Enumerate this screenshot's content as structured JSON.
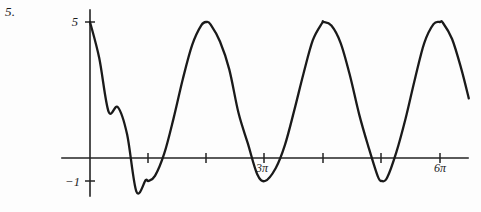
{
  "problem": {
    "number": "5."
  },
  "chart_data": {
    "type": "line",
    "title": "",
    "subtitle": "",
    "xlabel": "",
    "ylabel": "",
    "function_description": "y = 2 + 3 cos(x)",
    "amplitude": 3,
    "midline": 2,
    "period": "2π",
    "xlim": [
      0,
      20.4
    ],
    "ylim": [
      -1,
      5
    ],
    "grid": false,
    "legend": null,
    "axis_origin_label": "",
    "y_ticks": [
      {
        "value": 5,
        "label": "5"
      },
      {
        "value": -1,
        "label": "−1"
      }
    ],
    "x_ticks": [
      {
        "value": "π",
        "label": ""
      },
      {
        "value": "2π",
        "label": ""
      },
      {
        "value": "3π",
        "label": "3π"
      },
      {
        "value": "4π",
        "label": ""
      },
      {
        "value": "5π",
        "label": ""
      },
      {
        "value": "6π",
        "label": "6π"
      }
    ],
    "maxima": [
      {
        "x": "0",
        "y": 5
      },
      {
        "x": "2π",
        "y": 5
      },
      {
        "x": "4π",
        "y": 5
      },
      {
        "x": "6π",
        "y": 5
      }
    ],
    "minima": [
      {
        "x": "π",
        "y": -1
      },
      {
        "x": "3π",
        "y": -1
      },
      {
        "x": "5π",
        "y": -1
      }
    ],
    "series": [
      {
        "name": "y = 2 + 3 cos(x)",
        "color": "#1a1a1a",
        "x": [
          0,
          0.5,
          1,
          1.5,
          2,
          2.5,
          3,
          3.1416,
          3.5,
          4,
          4.5,
          5,
          5.5,
          6,
          6.2832,
          6.5,
          7,
          7.5,
          8,
          8.5,
          9,
          9.4248,
          10,
          10.5,
          11,
          11.5,
          12,
          12.5,
          12.5664,
          13,
          13.5,
          14,
          14.5,
          15,
          15.5,
          15.708,
          16,
          16.5,
          17,
          17.5,
          18,
          18.5,
          18.8496,
          19,
          19.5,
          20,
          20.4
        ],
        "y": [
          5,
          3.633,
          1.621,
          1.788,
          0.751,
          -1.403,
          -0.97,
          -1,
          -0.809,
          0.039,
          1.364,
          2.851,
          4.127,
          4.88,
          5,
          4.9,
          4.262,
          3.211,
          1.563,
          0.417,
          -0.733,
          -1,
          -0.517,
          0.363,
          1.664,
          3.055,
          4.313,
          4.962,
          5,
          4.864,
          4.205,
          2.98,
          1.506,
          0.28,
          -0.828,
          -1,
          -0.879,
          0.088,
          1.368,
          2.851,
          4.203,
          4.92,
          5,
          4.977,
          4.359,
          3.223,
          2.117
        ],
        "marker": "none",
        "line_style": "solid"
      }
    ]
  },
  "labels": {
    "y_max": "5",
    "y_min": "−1",
    "x_mid": "3π",
    "x_end": "6π"
  }
}
